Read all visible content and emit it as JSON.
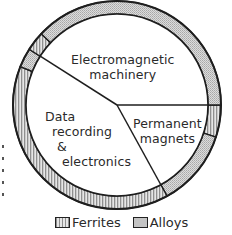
{
  "chart_data": {
    "type": "pie",
    "title": "",
    "inner_pie": {
      "categories": [
        "Electromagnetic machinery",
        "Permanent magnets",
        "Data recording & electronics"
      ],
      "angles_deg": [
        148,
        62,
        150
      ],
      "values_pct": [
        41,
        17,
        42
      ]
    },
    "outer_ring": {
      "series": [
        {
          "sector": "Permanent magnets",
          "name": "Ferrites",
          "pct_of_total": 5
        },
        {
          "sector": "Permanent magnets",
          "name": "Alloys",
          "pct_of_total": 12
        },
        {
          "sector": "Data recording & electronics",
          "name": "Ferrites",
          "pct_of_total": 39
        },
        {
          "sector": "Data recording & electronics",
          "name": "Alloys",
          "pct_of_total": 3
        },
        {
          "sector": "Electromagnetic machinery",
          "name": "Ferrites",
          "pct_of_total": 3
        },
        {
          "sector": "Electromagnetic machinery",
          "name": "Alloys",
          "pct_of_total": 38
        }
      ]
    },
    "legend": [
      "Ferrites",
      "Alloys"
    ],
    "legend_position": "bottom"
  },
  "labels": {
    "em_line1": "Electromagnetic",
    "em_line2": "machinery",
    "pm_line1": "Permanent",
    "pm_line2": "magnets",
    "dr_line1": "Data",
    "dr_line2": "recording",
    "dr_line3": "&",
    "dr_line4": "electronics"
  },
  "legend": {
    "ferrites": "Ferrites",
    "alloys": "Alloys"
  },
  "colors": {
    "outline": "#1e1e1e",
    "ferrite_fill": "#bdbdbd",
    "alloy_fill": "#cfcfcf"
  }
}
